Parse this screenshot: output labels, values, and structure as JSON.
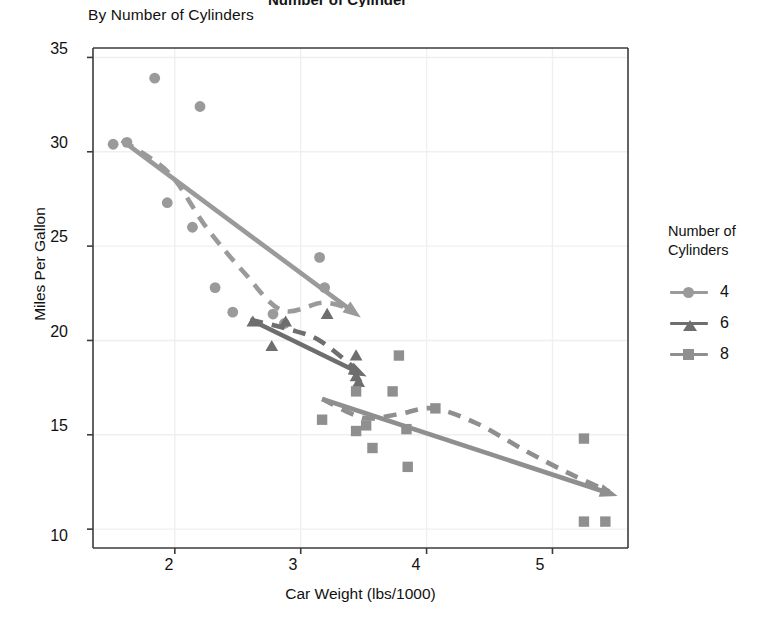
{
  "title_cut": "Number of Cylinders",
  "subtitle": "By Number of Cylinders",
  "axes": {
    "xlabel": "Car Weight (lbs/1000)",
    "ylabel": "Miles Per Gallon",
    "xticks": [
      "2",
      "3",
      "4",
      "5"
    ],
    "yticks": [
      "35",
      "30",
      "25",
      "20",
      "15",
      "10"
    ]
  },
  "legend": {
    "title_line1": "Number of",
    "title_line2": "Cylinders",
    "items": [
      {
        "label": "4",
        "marker": "circle",
        "color": "#9a9a9a"
      },
      {
        "label": "6",
        "marker": "triangle",
        "color": "#6e6e6e"
      },
      {
        "label": "8",
        "marker": "square",
        "color": "#8f8f8f"
      }
    ]
  },
  "colors": {
    "cyl4": "#9a9a9a",
    "cyl6": "#6e6e6e",
    "cyl8": "#8f8f8f",
    "axis": "#3b3b3b",
    "grid": "#efefef",
    "text": "#111111"
  },
  "chart_data": {
    "type": "scatter",
    "title": "Number of Cylinders",
    "subtitle": "By Number of Cylinders",
    "xlabel": "Car Weight (lbs/1000)",
    "ylabel": "Miles Per Gallon",
    "xlim": [
      1.35,
      5.6
    ],
    "ylim": [
      9.0,
      35.5
    ],
    "xticks": [
      2,
      3,
      4,
      5
    ],
    "yticks": [
      10,
      15,
      20,
      25,
      30,
      35
    ],
    "grid": true,
    "legend_position": "right",
    "legend_title": "Number of Cylinders",
    "series": [
      {
        "name": "4",
        "marker": "circle",
        "color": "#9a9a9a",
        "points": [
          [
            1.51,
            30.4
          ],
          [
            1.62,
            30.5
          ],
          [
            1.84,
            33.9
          ],
          [
            1.94,
            27.3
          ],
          [
            2.14,
            26.0
          ],
          [
            2.2,
            32.4
          ],
          [
            2.32,
            22.8
          ],
          [
            2.46,
            21.5
          ],
          [
            2.78,
            21.4
          ],
          [
            2.87,
            20.9
          ],
          [
            3.15,
            24.4
          ],
          [
            3.19,
            22.8
          ]
        ],
        "trend_line": {
          "style": "solid",
          "from": [
            1.58,
            30.6
          ],
          "to": [
            3.42,
            21.5
          ]
        },
        "fit_curve": {
          "style": "dashed",
          "points": [
            [
              1.58,
              30.6
            ],
            [
              1.95,
              28.9
            ],
            [
              2.25,
              26.0
            ],
            [
              2.55,
              23.6
            ],
            [
              2.85,
              21.6
            ],
            [
              3.18,
              22.0
            ],
            [
              3.42,
              21.6
            ]
          ]
        }
      },
      {
        "name": "6",
        "marker": "triangle",
        "color": "#6e6e6e",
        "points": [
          [
            2.62,
            21.0
          ],
          [
            2.77,
            19.7
          ],
          [
            2.88,
            21.0
          ],
          [
            3.21,
            21.4
          ],
          [
            3.44,
            19.2
          ],
          [
            3.44,
            18.1
          ],
          [
            3.46,
            17.8
          ]
        ],
        "trend_line": {
          "style": "solid",
          "from": [
            2.6,
            21.1
          ],
          "to": [
            3.46,
            18.3
          ]
        },
        "fit_curve": {
          "style": "dashed",
          "points": [
            [
              2.6,
              21.1
            ],
            [
              2.9,
              20.6
            ],
            [
              3.15,
              20.0
            ],
            [
              3.45,
              18.4
            ]
          ]
        }
      },
      {
        "name": "8",
        "marker": "square",
        "color": "#8f8f8f",
        "points": [
          [
            3.17,
            15.8
          ],
          [
            3.44,
            15.2
          ],
          [
            3.52,
            15.5
          ],
          [
            3.57,
            14.3
          ],
          [
            3.44,
            17.3
          ],
          [
            3.73,
            17.3
          ],
          [
            3.78,
            19.2
          ],
          [
            3.84,
            15.3
          ],
          [
            3.85,
            13.3
          ],
          [
            4.07,
            16.4
          ],
          [
            5.25,
            14.8
          ],
          [
            5.25,
            10.4
          ],
          [
            5.42,
            10.4
          ]
        ],
        "trend_line": {
          "style": "solid",
          "from": [
            3.17,
            16.9
          ],
          "to": [
            5.45,
            11.9
          ]
        },
        "fit_curve": {
          "style": "dashed",
          "points": [
            [
              3.17,
              16.9
            ],
            [
              3.5,
              15.9
            ],
            [
              3.78,
              16.1
            ],
            [
              4.05,
              16.4
            ],
            [
              4.4,
              15.6
            ],
            [
              4.8,
              14.1
            ],
            [
              5.15,
              12.9
            ],
            [
              5.45,
              12.0
            ]
          ]
        }
      }
    ]
  }
}
